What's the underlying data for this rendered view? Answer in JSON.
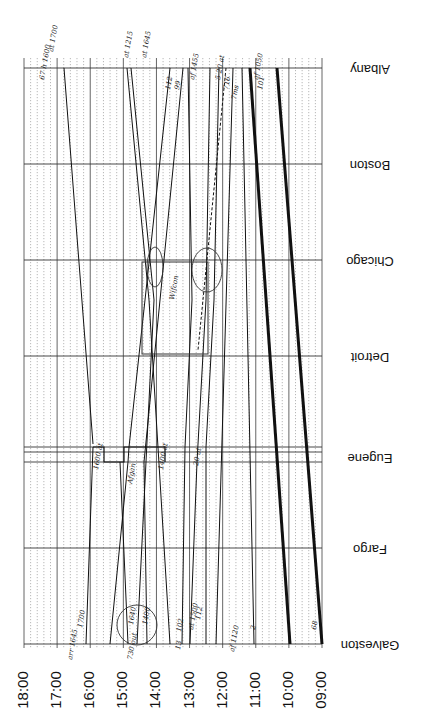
{
  "orientation": "rotated-180",
  "chart_data": {
    "type": "line",
    "title": "",
    "xlabel": "Time",
    "ylabel": "Station",
    "time_ticks": [
      "18:00",
      "17:00",
      "16:00",
      "15:00",
      "14:00",
      "13:00",
      "12:00",
      "11:00",
      "10:00",
      "09:00"
    ],
    "stations": [
      "Albany",
      "Boston",
      "Chicago",
      "Detroit",
      "Eugene",
      "Fargo",
      "Galveston"
    ],
    "grid": {
      "hourly_solid": true,
      "subdivisions_dotted": 4
    },
    "trains": [
      {
        "label": "68",
        "from": "Galveston",
        "to": "Albany",
        "dep": "09:00",
        "arr": "10:25",
        "weight": "heavy"
      },
      {
        "label": "101",
        "from": "Albany",
        "to": "Galveston",
        "dep": "09:40",
        "arr": "11:00",
        "weight": "heavy"
      },
      {
        "label": "2",
        "from": "Galveston",
        "to": "Albany",
        "dep": "11:05",
        "arr": "12:20",
        "weight": "normal"
      },
      {
        "label": "112",
        "from": "Galveston",
        "to": "Albany",
        "dep": "12:35",
        "arr": "14:00",
        "weight": "normal"
      },
      {
        "label": "102",
        "from": "Galveston",
        "to": "Albany",
        "dep": "13:10",
        "arr": "14:20",
        "weight": "normal"
      },
      {
        "label": "1400",
        "from": "Galveston",
        "to": "Eugene",
        "dep": "14:25",
        "arr": "13:45",
        "weight": "normal"
      },
      {
        "label": "1640",
        "from": "Galveston",
        "to": "Albany",
        "dep": "14:40",
        "arr": "16:45",
        "weight": "normal"
      },
      {
        "label": "1700",
        "from": "Galveston",
        "to": "Eugene",
        "dep": "16:00",
        "arr": "16:45",
        "weight": "normal"
      },
      {
        "label": "1450",
        "from": "Albany",
        "to": "Galveston",
        "dep": "12:00",
        "arr": "14:45",
        "weight": "normal"
      },
      {
        "label": "99",
        "from": "Albany",
        "to": "Galveston",
        "dep": "14:00",
        "arr": "12:35",
        "weight": "normal"
      },
      {
        "label": "1455",
        "from": "Albany",
        "to": "Galveston",
        "dep": "13:25",
        "arr": "13:00",
        "weight": "normal"
      },
      {
        "label": "1700 (Albany)",
        "from": "Albany",
        "to": "Galveston",
        "dep": "17:00",
        "arr": "16:00",
        "weight": "normal"
      }
    ],
    "annotations": [
      "68",
      "101",
      "2",
      "112",
      "102",
      "1400",
      "1640",
      "1700",
      "af 1120",
      "13",
      "at 1500",
      "730 out",
      "arr 1645",
      "1600 at",
      "1400 at",
      "Afgan",
      "Wifcon",
      "af 1455",
      "5 20 at",
      "716",
      "7ms",
      "af 1050",
      "at 1215",
      "at 1645",
      "99",
      "112",
      "67 h 1600",
      "at 1700",
      "20 at"
    ]
  },
  "labels": {
    "stations": [
      "Albany",
      "Boston",
      "Chicago",
      "Detroit",
      "Eugene",
      "Fargo",
      "Galveston"
    ],
    "times": [
      "18:00",
      "17:00",
      "16:00",
      "15:00",
      "14:00",
      "13:00",
      "12:00",
      "11:00",
      "10:00",
      "09:00"
    ]
  }
}
